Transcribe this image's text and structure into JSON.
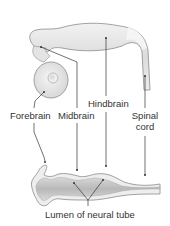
{
  "diagram": {
    "labels": {
      "forebrain": "Forebrain",
      "midbrain": "Midbrain",
      "hindbrain": "Hindbrain",
      "spinal_cord_line1": "Spinal",
      "spinal_cord_line2": "cord",
      "lumen": "Lumen of neural tube"
    },
    "colors": {
      "tissue_fill": "#e6e6e6",
      "tissue_edge": "#8c8c8c",
      "lumen_fill": "#c4c4c4",
      "leader_line": "#333333",
      "text": "#333333"
    }
  }
}
